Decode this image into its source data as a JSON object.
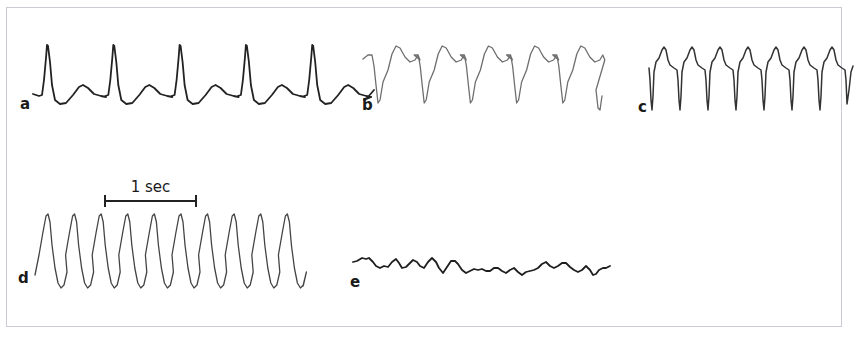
{
  "figure": {
    "frame_color": "#c9ccd6",
    "background": "#ffffff",
    "scale_bar": {
      "label": "1 sec",
      "x1": 105,
      "x2": 196,
      "y": 201,
      "tick_half": 6,
      "color": "#222222"
    },
    "panels": [
      {
        "id": "a",
        "label": "a",
        "label_pos": [
          20,
          109
        ],
        "stroke": "#222222",
        "stroke_width": 1.8,
        "description": "Regular tracing with sharp narrow spikes and rounded humps",
        "start": [
          33,
          94
        ],
        "cycle_dx": 66.3,
        "cycles": 5,
        "cycle_points": [
          [
            6,
            96
          ],
          [
            9,
            95
          ],
          [
            11,
            80
          ],
          [
            13,
            58
          ],
          [
            14,
            45
          ],
          [
            15,
            46
          ],
          [
            17,
            62
          ],
          [
            19,
            85
          ],
          [
            22,
            100
          ],
          [
            27,
            104
          ],
          [
            33,
            103
          ],
          [
            40,
            95
          ],
          [
            46,
            87
          ],
          [
            50,
            85
          ],
          [
            55,
            88
          ],
          [
            61,
            94
          ],
          [
            68,
            96
          ],
          [
            73,
            97
          ]
        ],
        "tail": [
          [
            364,
            100
          ],
          [
            368,
            97
          ],
          [
            374,
            90
          ]
        ]
      },
      {
        "id": "b",
        "label": "b",
        "label_pos": [
          362,
          110
        ],
        "stroke": "#6e6e6e",
        "stroke_width": 1.3,
        "description": "Broad waves with deep troughs and double-humped crests",
        "start": [
          363,
          59
        ],
        "cycle_dx": 46.2,
        "cycles": 5,
        "cycle_points": [
          [
            5,
            55
          ],
          [
            9,
            55
          ],
          [
            11,
            66
          ],
          [
            13,
            85
          ],
          [
            15,
            103
          ],
          [
            17,
            100
          ],
          [
            20,
            82
          ],
          [
            25,
            70
          ],
          [
            29,
            54
          ],
          [
            33,
            46
          ],
          [
            37,
            48
          ],
          [
            42,
            57
          ],
          [
            47,
            62
          ],
          [
            52,
            60
          ],
          [
            55,
            55
          ],
          [
            57,
            60
          ]
        ],
        "tail": [
          [
            596,
            90
          ],
          [
            598,
            108
          ],
          [
            600,
            110
          ],
          [
            602,
            96
          ]
        ]
      },
      {
        "id": "c",
        "label": "c",
        "label_pos": [
          638,
          112
        ],
        "stroke": "#333333",
        "stroke_width": 1.5,
        "description": "Rapid regular complexes with deep narrow downward spikes",
        "start": [
          649,
          68
        ],
        "cycle_dx": 28,
        "cycles": 7,
        "cycle_points": [
          [
            1,
            80
          ],
          [
            2,
            100
          ],
          [
            3,
            110
          ],
          [
            4,
            96
          ],
          [
            5,
            72
          ],
          [
            7,
            62
          ],
          [
            10,
            58
          ],
          [
            13,
            50
          ],
          [
            15,
            47
          ],
          [
            17,
            50
          ],
          [
            19,
            60
          ],
          [
            21,
            65
          ],
          [
            25,
            68
          ],
          [
            28,
            70
          ],
          [
            29,
            80
          ]
        ],
        "tail": [
          [
            847,
            104
          ],
          [
            849,
            90
          ],
          [
            851,
            72
          ],
          [
            853,
            66
          ]
        ]
      },
      {
        "id": "d",
        "label": "d",
        "label_pos": [
          18,
          283
        ],
        "stroke": "#444444",
        "stroke_width": 1.3,
        "description": "Sinusoidal-like regular large-amplitude oscillation",
        "start": [
          35,
          275
        ],
        "cycle_dx": 26.6,
        "cycles": 10,
        "cycle_points": [
          [
            4,
            255
          ],
          [
            8,
            232
          ],
          [
            11,
            216
          ],
          [
            13,
            214
          ],
          [
            15,
            222
          ],
          [
            17,
            245
          ],
          [
            20,
            268
          ],
          [
            23,
            283
          ],
          [
            26,
            288
          ],
          [
            29,
            285
          ],
          [
            32,
            272
          ]
        ],
        "tail": [
          [
            303,
            286
          ]
        ]
      },
      {
        "id": "e",
        "label": "e",
        "label_pos": [
          350,
          287
        ],
        "stroke": "#1e1e1e",
        "stroke_width": 1.8,
        "description": "Irregular low-amplitude chaotic undulation",
        "points": [
          [
            353,
            262
          ],
          [
            357,
            261
          ],
          [
            362,
            258
          ],
          [
            366,
            259
          ],
          [
            369,
            258
          ],
          [
            373,
            262
          ],
          [
            376,
            266
          ],
          [
            380,
            268
          ],
          [
            384,
            266
          ],
          [
            388,
            267
          ],
          [
            392,
            262
          ],
          [
            396,
            259
          ],
          [
            399,
            263
          ],
          [
            402,
            268
          ],
          [
            406,
            267
          ],
          [
            410,
            263
          ],
          [
            413,
            260
          ],
          [
            417,
            262
          ],
          [
            420,
            266
          ],
          [
            424,
            268
          ],
          [
            428,
            262
          ],
          [
            432,
            258
          ],
          [
            436,
            262
          ],
          [
            439,
            268
          ],
          [
            443,
            273
          ],
          [
            447,
            267
          ],
          [
            451,
            261
          ],
          [
            455,
            261
          ],
          [
            458,
            264
          ],
          [
            462,
            270
          ],
          [
            466,
            273
          ],
          [
            470,
            271
          ],
          [
            474,
            269
          ],
          [
            478,
            270
          ],
          [
            482,
            269
          ],
          [
            486,
            271
          ],
          [
            490,
            271
          ],
          [
            494,
            268
          ],
          [
            498,
            268
          ],
          [
            502,
            271
          ],
          [
            506,
            273
          ],
          [
            510,
            270
          ],
          [
            514,
            268
          ],
          [
            518,
            272
          ],
          [
            522,
            275
          ],
          [
            526,
            272
          ],
          [
            530,
            271
          ],
          [
            534,
            270
          ],
          [
            538,
            268
          ],
          [
            542,
            264
          ],
          [
            546,
            262
          ],
          [
            550,
            266
          ],
          [
            554,
            268
          ],
          [
            558,
            266
          ],
          [
            562,
            263
          ],
          [
            566,
            263
          ],
          [
            570,
            267
          ],
          [
            574,
            270
          ],
          [
            578,
            272
          ],
          [
            582,
            270
          ],
          [
            586,
            266
          ],
          [
            590,
            270
          ],
          [
            593,
            275
          ],
          [
            596,
            274
          ],
          [
            599,
            270
          ],
          [
            603,
            268
          ],
          [
            606,
            268
          ],
          [
            610,
            266
          ]
        ]
      }
    ]
  }
}
